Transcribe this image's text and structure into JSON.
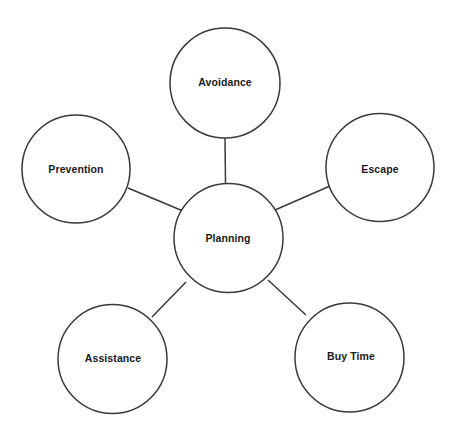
{
  "diagram": {
    "type": "mind-map",
    "title": "Planning",
    "background_color": "#ffffff",
    "stroke_color": "#3a3a3a",
    "text_color": "#1a1a1a",
    "center": {
      "id": "planning",
      "label": "Planning",
      "cx": 228.5,
      "cy": 238,
      "r": 54.5,
      "label_x": 228,
      "label_y": 239
    },
    "branches": [
      {
        "id": "avoidance",
        "label": "Avoidance",
        "cx": 225,
        "cy": 83,
        "r": 55,
        "label_x": 225,
        "label_y": 83
      },
      {
        "id": "escape",
        "label": "Escape",
        "cx": 380,
        "cy": 167.5,
        "r": 54,
        "label_x": 380,
        "label_y": 170
      },
      {
        "id": "buy-time",
        "label": "Buy Time",
        "cx": 349.5,
        "cy": 357.5,
        "r": 54.5,
        "label_x": 351,
        "label_y": 357
      },
      {
        "id": "assistance",
        "label": "Assistance",
        "cx": 112.5,
        "cy": 359,
        "r": 54.5,
        "label_x": 113,
        "label_y": 359
      },
      {
        "id": "prevention",
        "label": "Prevention",
        "cx": 76,
        "cy": 169,
        "r": 54,
        "label_x": 76,
        "label_y": 170
      }
    ],
    "connectors": [
      {
        "id": "avoidance-planning",
        "from": "avoidance",
        "to": "planning",
        "x1": 225,
        "y1": 138,
        "x2": 225.5,
        "y2": 184
      },
      {
        "id": "escape-planning",
        "from": "escape",
        "to": "planning",
        "x1": 330,
        "y1": 186,
        "x2": 275,
        "y2": 210
      },
      {
        "id": "buytime-planning",
        "from": "buy-time",
        "to": "planning",
        "x1": 306,
        "y1": 315,
        "x2": 268,
        "y2": 280
      },
      {
        "id": "assistance-planning",
        "from": "assistance",
        "to": "planning",
        "x1": 152,
        "y1": 317,
        "x2": 186,
        "y2": 282
      },
      {
        "id": "prevention-planning",
        "from": "prevention",
        "to": "planning",
        "x1": 128,
        "y1": 188,
        "x2": 183,
        "y2": 211
      }
    ]
  }
}
